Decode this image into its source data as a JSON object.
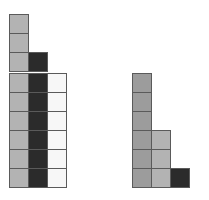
{
  "diagram": {
    "colors": {
      "light": "#b3b3b3",
      "mid": "#9c9c9c",
      "dark": "#2b2b2b",
      "white": "#f7f7f7",
      "border": "#5a5a5a"
    },
    "cell_size": 19,
    "groups": [
      {
        "name": "left-top-stack",
        "origin": [
          9,
          14
        ],
        "cells": [
          {
            "col": 0,
            "row": 0,
            "color": "light"
          },
          {
            "col": 0,
            "row": 1,
            "color": "light"
          },
          {
            "col": 0,
            "row": 2,
            "color": "light"
          },
          {
            "col": 1,
            "row": 2,
            "color": "dark"
          }
        ]
      },
      {
        "name": "left-bottom-grid",
        "origin": [
          9,
          73
        ],
        "columns": 3,
        "rows": 6,
        "column_colors": [
          "light",
          "dark",
          "white"
        ]
      },
      {
        "name": "right-staircase",
        "origin": [
          132,
          73
        ],
        "columns": [
          {
            "col": 0,
            "height": 6,
            "color": "mid"
          },
          {
            "col": 1,
            "height": 3,
            "color": "light"
          },
          {
            "col": 2,
            "height": 1,
            "color": "dark"
          }
        ],
        "rows": 6
      }
    ]
  }
}
